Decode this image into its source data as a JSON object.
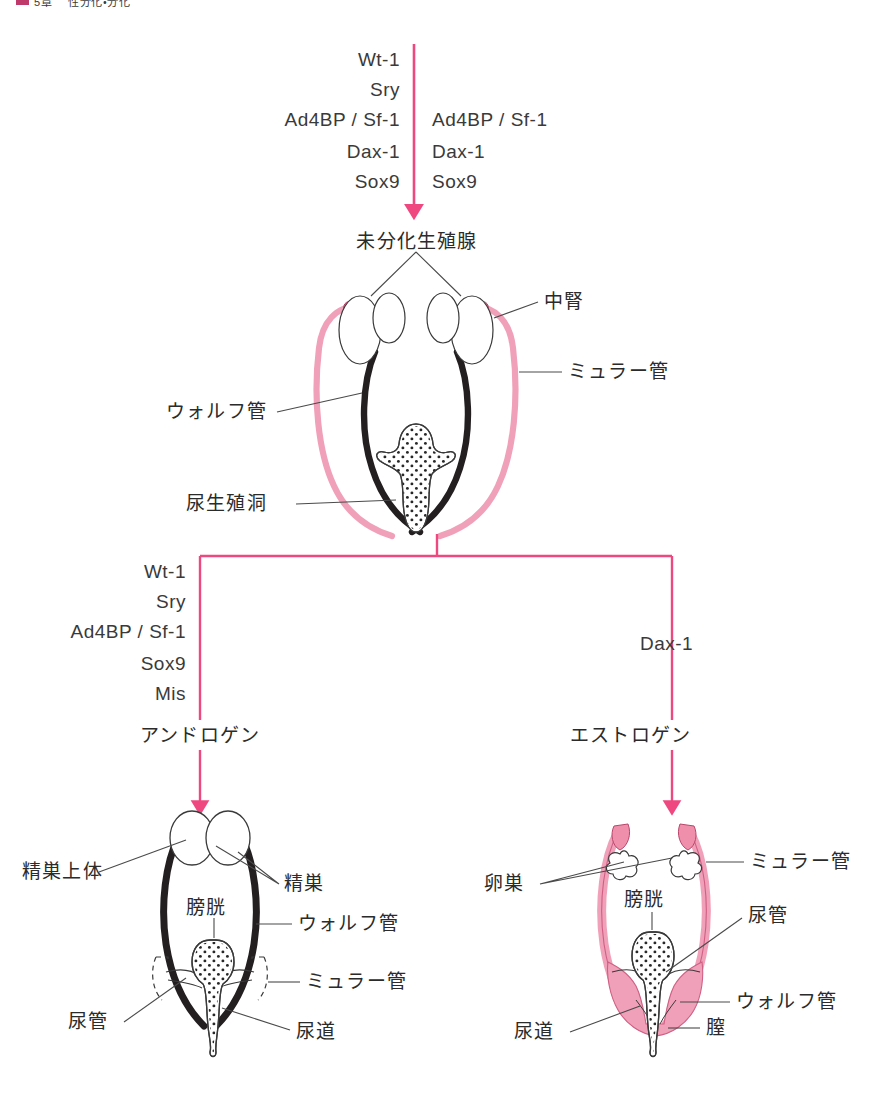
{
  "header": {
    "chapter": "5章",
    "title": "性分化・分化",
    "marker": "square-marker"
  },
  "colors": {
    "pink_arrow": "#ef4880",
    "pink_fill": "#f0a0b8",
    "pink_outline": "#cf5f84",
    "dark_duct": "#231f20",
    "outline": "#3a3a3a",
    "leader_line": "#4a4a4a"
  },
  "top_stage": {
    "genes_left": [
      "Wt-1",
      "Sry",
      "Ad4BP / Sf-1",
      "Dax-1",
      "Sox9"
    ],
    "genes_right": [
      "Ad4BP / Sf-1",
      "Dax-1",
      "Sox9"
    ],
    "arrow": "down-arrow-pink"
  },
  "undifferentiated": {
    "title": "未分化生殖腺",
    "labels": [
      {
        "text": "中腎",
        "side": "right"
      },
      {
        "text": "ミュラー管",
        "side": "right"
      },
      {
        "text": "ウォルフ管",
        "side": "left"
      },
      {
        "text": "尿生殖洞",
        "side": "left"
      }
    ]
  },
  "branch": {
    "connector": "tee-connector-pink",
    "male": {
      "genes": [
        "Wt-1",
        "Sry",
        "Ad4BP / Sf-1",
        "Sox9",
        "Mis"
      ],
      "hormone": "アンドロゲン",
      "arrow": "down-arrow-pink"
    },
    "female": {
      "genes": [
        "Dax-1"
      ],
      "hormone": "エストロゲン",
      "arrow": "down-arrow-pink"
    }
  },
  "male_organ": {
    "labels": [
      {
        "text": "精巣上体",
        "side": "left"
      },
      {
        "text": "精巣",
        "side": "right"
      },
      {
        "text": "膀胱",
        "side": "center"
      },
      {
        "text": "ウォルフ管",
        "side": "right"
      },
      {
        "text": "ミュラー管",
        "side": "right"
      },
      {
        "text": "尿管",
        "side": "left"
      },
      {
        "text": "尿道",
        "side": "right"
      }
    ]
  },
  "female_organ": {
    "labels": [
      {
        "text": "卵巣",
        "side": "left"
      },
      {
        "text": "ミュラー管",
        "side": "right"
      },
      {
        "text": "膀胱",
        "side": "center"
      },
      {
        "text": "尿管",
        "side": "right"
      },
      {
        "text": "ウォルフ管",
        "side": "right"
      },
      {
        "text": "尿道",
        "side": "left"
      },
      {
        "text": "膣",
        "side": "right"
      }
    ]
  }
}
